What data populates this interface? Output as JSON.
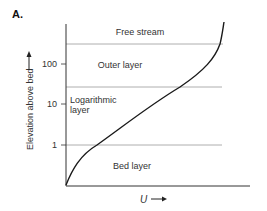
{
  "panel_label": "A.",
  "y_axis": {
    "title": "Elevation above bed",
    "ticks": [
      {
        "label": "100",
        "y": 64
      },
      {
        "label": "10",
        "y": 104
      },
      {
        "label": "1",
        "y": 145
      }
    ]
  },
  "x_axis": {
    "title": "U",
    "arrow": "→"
  },
  "layers": [
    {
      "name": "Free stream",
      "label_x": 140,
      "label_y": 35
    },
    {
      "name": "Outer layer",
      "label_x": 120,
      "label_y": 66
    },
    {
      "name_line1": "Logarithmic",
      "name_line2": "layer",
      "label_x": 70,
      "label_y": 106
    },
    {
      "name": "Bed layer",
      "label_x": 132,
      "label_y": 166
    }
  ],
  "boundaries_y": [
    44,
    87,
    145
  ],
  "colors": {
    "axis": "#333333",
    "curve": "#1a1a1a",
    "boundary": "#999999"
  }
}
